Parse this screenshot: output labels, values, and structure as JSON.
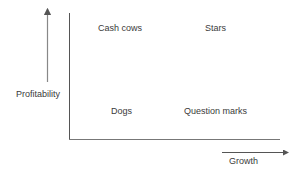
{
  "diagram": {
    "type": "BCG growth-share matrix",
    "quadrants": {
      "top_left": "Cash cows",
      "top_right": "Stars",
      "bottom_left": "Dogs",
      "bottom_right": "Question marks"
    },
    "y_axis_label": "Profitability",
    "x_axis_label": "Growth",
    "colors": {
      "axis": "#555555",
      "arrow": "#777777",
      "text": "#3a3a3a"
    }
  }
}
